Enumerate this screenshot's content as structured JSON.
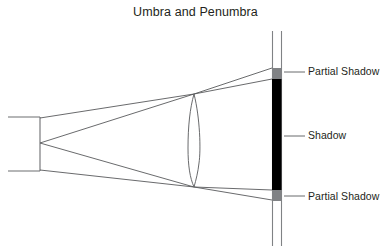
{
  "title": "Umbra and Penumbra",
  "labels": {
    "partial_shadow_top": "Partial Shadow",
    "shadow": "Shadow",
    "partial_shadow_bottom": "Partial Shadow"
  },
  "colors": {
    "text": "#231f20",
    "ray_line": "#58595b",
    "outline": "#6d6e71",
    "umbra": "#000000",
    "penumbra": "#808285",
    "background": "#ffffff"
  },
  "diagram": {
    "type": "optics-ray-diagram",
    "light_source": {
      "name": "light-source-box",
      "x": 8,
      "y": 117,
      "width": 32,
      "height": 54,
      "open_side": "left"
    },
    "lens": {
      "name": "lens",
      "center_x": 194,
      "top_y": 94,
      "bottom_y": 187,
      "half_width": 6
    },
    "screen": {
      "name": "projection-screen",
      "line1_x": 272,
      "line2_x": 281,
      "top_y": 31,
      "bottom_y": 246
    },
    "bands": [
      {
        "name": "penumbra-top",
        "kind": "penumbra",
        "x": 272,
        "y": 68,
        "width": 9,
        "height": 11
      },
      {
        "name": "umbra",
        "kind": "umbra",
        "x": 272,
        "y": 79,
        "width": 9,
        "height": 111
      },
      {
        "name": "penumbra-bottom",
        "kind": "penumbra",
        "x": 272,
        "y": 190,
        "width": 9,
        "height": 11
      }
    ],
    "rays": [
      {
        "name": "ray-top-edge-upper",
        "points": "40,118 194,94 272,68"
      },
      {
        "name": "ray-top-edge-lower",
        "points": "40,143 194,94 272,79"
      },
      {
        "name": "ray-bottom-edge-lower",
        "points": "40,170 194,187 272,200"
      },
      {
        "name": "ray-bottom-edge-upper",
        "points": "40,143 194,187 272,190"
      }
    ],
    "leader_lines": [
      {
        "name": "leader-partial-shadow-top",
        "x1": 284,
        "y1": 72,
        "x2": 304,
        "y2": 72
      },
      {
        "name": "leader-shadow",
        "x1": 284,
        "y1": 136,
        "x2": 304,
        "y2": 136
      },
      {
        "name": "leader-partial-shadow-bottom",
        "x1": 284,
        "y1": 196,
        "x2": 304,
        "y2": 196
      }
    ]
  }
}
